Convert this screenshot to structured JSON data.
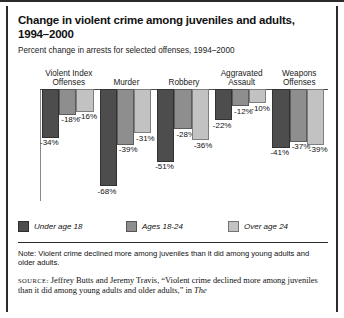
{
  "title": "Change in violent crime among juveniles and adults, 1994–2000",
  "subtitle": "Percent change in arrests for selected offenses, 1994–2000",
  "note": "Note: Violent crime declined more among juveniles than it did among young adults and older adults.",
  "source": {
    "label": "SOURCE:",
    "text": " Jeffrey Butts and Jeremy Travis, “Violent crime declined more among juveniles than it did among young adults and older adults,” in ",
    "italic_tail": "The"
  },
  "colors": {
    "series_under18": "#4d4d4d",
    "series_18_24": "#8e8e8e",
    "series_over24": "#c2c2c2",
    "axis": "#4a4a4a",
    "text": "#111111"
  },
  "legend": [
    {
      "label": "Under age 18",
      "color": "#4d4d4d"
    },
    {
      "label": "Ages 18-24",
      "color": "#8e8e8e"
    },
    {
      "label": "Over age 24",
      "color": "#c2c2c2"
    }
  ],
  "chart_data": {
    "type": "bar",
    "title": "Change in violent crime among juveniles and adults, 1994–2000",
    "subtitle": "Percent change in arrests for selected offenses, 1994–2000",
    "xlabel": "",
    "ylabel": "Percent change",
    "ylim": [
      -70,
      0
    ],
    "grid": false,
    "legend_position": "bottom",
    "categories": [
      "Violent Index Offenses",
      "Murder",
      "Robbery",
      "Aggravated Assault",
      "Weapons Offenses"
    ],
    "category_lines": [
      [
        "Violent Index",
        "Offenses"
      ],
      [
        "Murder"
      ],
      [
        "Robbery"
      ],
      [
        "Aggravated",
        "Assault"
      ],
      [
        "Weapons",
        "Offenses"
      ]
    ],
    "series": [
      {
        "name": "Under age 18",
        "color": "#4d4d4d",
        "values": [
          -34,
          -68,
          -51,
          -22,
          -41
        ],
        "labels": [
          "-34%",
          "-68%",
          "-51%",
          "-22%",
          "-41%"
        ]
      },
      {
        "name": "Ages 18-24",
        "color": "#8e8e8e",
        "values": [
          -18,
          -39,
          -28,
          -12,
          -37
        ],
        "labels": [
          "-18%",
          "-39%",
          "-28%",
          "-12%",
          "-37%"
        ]
      },
      {
        "name": "Over age 24",
        "color": "#c2c2c2",
        "values": [
          -16,
          -31,
          -36,
          -10,
          -39
        ],
        "labels": [
          "-16%",
          "-31%",
          "-36%",
          "-10%",
          "-39%"
        ]
      }
    ]
  }
}
